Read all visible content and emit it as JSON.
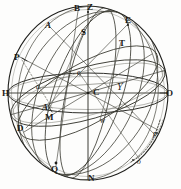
{
  "figure": {
    "type": "astronomical-sphere-diagram",
    "colors": {
      "ink": "#1a1a18",
      "ink_light": "#555550",
      "ink_faint": "#8a8a84",
      "paper": "#fdfdfc"
    },
    "geometry": {
      "sphere_center_x": 88,
      "sphere_center_y": 93,
      "sphere_radius_x": 80,
      "sphere_radius_y": 87
    }
  },
  "labels": [
    {
      "id": "label-B",
      "text": "B",
      "x": 74,
      "y": 4,
      "style": "cap"
    },
    {
      "id": "label-Z",
      "text": "Z",
      "x": 87,
      "y": 3,
      "style": "cap"
    },
    {
      "id": "label-E",
      "text": "E",
      "x": 125,
      "y": 16,
      "style": "cap"
    },
    {
      "id": "label-A-upper",
      "text": "A",
      "x": 45,
      "y": 21,
      "style": "ital"
    },
    {
      "id": "label-S",
      "text": "S",
      "x": 81,
      "y": 28,
      "style": "cap"
    },
    {
      "id": "label-T",
      "text": "T",
      "x": 119,
      "y": 39,
      "style": "cap"
    },
    {
      "id": "label-P",
      "text": "P",
      "x": 14,
      "y": 53,
      "style": "cap"
    },
    {
      "id": "label-e",
      "text": "e",
      "x": 77,
      "y": 69,
      "style": "small"
    },
    {
      "id": "label-a",
      "text": "a",
      "x": 36,
      "y": 83,
      "style": "small"
    },
    {
      "id": "label-H",
      "text": "H",
      "x": 2,
      "y": 89,
      "style": "cap"
    },
    {
      "id": "label-C",
      "text": "C",
      "x": 93,
      "y": 88,
      "style": "cap"
    },
    {
      "id": "label-aries",
      "text": "Υ",
      "x": 117,
      "y": 82,
      "style": "sym"
    },
    {
      "id": "label-O",
      "text": "O",
      "x": 166,
      "y": 89,
      "style": "cap"
    },
    {
      "id": "label-A-lower",
      "text": "A",
      "x": 42,
      "y": 103,
      "style": "ital"
    },
    {
      "id": "label-M",
      "text": "M",
      "x": 45,
      "y": 113,
      "style": "cap"
    },
    {
      "id": "label-w",
      "text": "w",
      "x": 100,
      "y": 117,
      "style": "small"
    },
    {
      "id": "label-D",
      "text": "D",
      "x": 17,
      "y": 124,
      "style": "cap"
    },
    {
      "id": "label-p",
      "text": "p",
      "x": 153,
      "y": 130,
      "style": "small"
    },
    {
      "id": "label-o",
      "text": "o",
      "x": 137,
      "y": 158,
      "style": "small"
    },
    {
      "id": "label-Q",
      "text": "Q",
      "x": 51,
      "y": 165,
      "style": "cap"
    },
    {
      "id": "label-N",
      "text": "N",
      "x": 88,
      "y": 174,
      "style": "cap"
    }
  ],
  "circles": [
    {
      "id": "sphere-outline",
      "name": "sphere-limb"
    },
    {
      "id": "horizon-circle",
      "name": "horizon-HO"
    },
    {
      "id": "meridian-BZN",
      "name": "meridian-vertical"
    },
    {
      "id": "equator-circle",
      "name": "celestial-equator"
    },
    {
      "id": "ecliptic-circle",
      "name": "ecliptic"
    },
    {
      "id": "colure-PD",
      "name": "colure-through-P-D"
    },
    {
      "id": "hour-circle-AQ",
      "name": "hour-circle-A-Q"
    },
    {
      "id": "hour-circle-BQ",
      "name": "hour-circle-B-Q"
    },
    {
      "id": "hour-circle-EQ",
      "name": "hour-circle-E-Q"
    },
    {
      "id": "dotted-arc-po",
      "name": "dotted-arc-p-o"
    }
  ]
}
